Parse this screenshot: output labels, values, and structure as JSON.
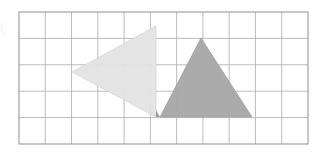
{
  "figure": {
    "background_color": "#ffffff"
  },
  "grid": {
    "name": "square-grid",
    "x": 19,
    "y": 12,
    "width": 289,
    "height": 132,
    "columns": 11,
    "rows": 5,
    "cell_width": 26.27,
    "cell_height": 26.4,
    "line_color": "#b4b4b4",
    "line_width": 0.9,
    "border_color": "#9a9a9a",
    "border_width": 1.1
  },
  "shapes": [
    {
      "id": "light-triangle",
      "name": "light-triangle",
      "label": "Light left-pointing triangle",
      "fill": "#e4e4e4",
      "stroke": "#d2d2d2",
      "stroke_width": 0.8,
      "opacity": 0.95,
      "points": "72,72 156,26 156,117",
      "vertices": [
        {
          "x": 72,
          "y": 72
        },
        {
          "x": 156,
          "y": 26
        },
        {
          "x": 156,
          "y": 117
        }
      ]
    },
    {
      "id": "dark-triangle",
      "name": "dark-triangle",
      "label": "Dark upright triangle",
      "fill": "#a9a9a9",
      "stroke": "#9c9c9c",
      "stroke_width": 0.8,
      "opacity": 0.97,
      "points": "201,38 252,117 160,117",
      "vertices": [
        {
          "x": 201,
          "y": 38
        },
        {
          "x": 252,
          "y": 117
        },
        {
          "x": 160,
          "y": 117
        }
      ]
    }
  ],
  "overlap": {
    "name": "triangle-overlap-region",
    "fill": "#9f9f9f",
    "points": "160,117 156,117 156,110"
  },
  "artifacts": {
    "page_edge": {
      "name": "page-edge-mark",
      "color": "#e6e6e6"
    }
  }
}
